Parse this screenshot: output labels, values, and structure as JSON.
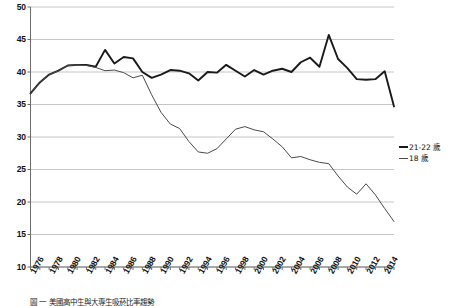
{
  "chart_data": {
    "type": "line",
    "title": "",
    "xlabel": "",
    "ylabel": "",
    "xlim": [
      1976,
      2015
    ],
    "ylim": [
      10,
      50
    ],
    "grid": true,
    "grid_axis": "y",
    "legend_position": "right",
    "y_ticks": [
      50,
      45,
      40,
      35,
      30,
      25,
      20,
      15,
      10
    ],
    "x_ticks": [
      1976,
      1978,
      1980,
      1982,
      1984,
      1986,
      1988,
      1990,
      1992,
      1994,
      1996,
      1998,
      2000,
      2002,
      2004,
      2006,
      2008,
      2010,
      2012,
      2014
    ],
    "x": [
      1976,
      1977,
      1978,
      1979,
      1980,
      1981,
      1982,
      1983,
      1984,
      1985,
      1986,
      1987,
      1988,
      1989,
      1990,
      1991,
      1992,
      1993,
      1994,
      1995,
      1996,
      1997,
      1998,
      1999,
      2000,
      2001,
      2002,
      2003,
      2004,
      2005,
      2006,
      2007,
      2008,
      2009,
      2010,
      2011,
      2012,
      2013,
      2014,
      2015
    ],
    "series": [
      {
        "name": "21-22 歲",
        "style": "thick",
        "color": "#1a1a1a",
        "values": [
          36.7,
          38.4,
          39.6,
          40.2,
          41.0,
          41.1,
          41.1,
          40.8,
          43.4,
          41.3,
          42.3,
          42.1,
          40.0,
          39.1,
          39.6,
          40.3,
          40.2,
          39.8,
          38.7,
          40.0,
          39.9,
          41.1,
          40.2,
          39.3,
          40.3,
          39.6,
          40.2,
          40.5,
          40.0,
          41.5,
          42.2,
          40.8,
          45.7,
          42.0,
          40.6,
          38.9,
          38.8,
          38.9,
          40.1,
          34.7
        ]
      },
      {
        "name": "18 歲",
        "style": "thin",
        "color": "#4a4a4a",
        "values": [
          36.7,
          38.4,
          39.6,
          40.2,
          41.0,
          41.1,
          41.0,
          40.7,
          40.2,
          40.3,
          39.9,
          39.1,
          39.5,
          36.5,
          33.8,
          32.0,
          31.3,
          29.3,
          27.7,
          27.5,
          28.2,
          29.7,
          31.2,
          31.6,
          31.1,
          30.8,
          29.7,
          28.5,
          26.8,
          27.0,
          26.5,
          26.1,
          25.9,
          24.0,
          22.3,
          21.2,
          22.8,
          21.1,
          19.0,
          17.0
        ]
      }
    ]
  },
  "legend": {
    "entries": [
      {
        "label": "21-22 歲",
        "style": "thick"
      },
      {
        "label": "18 歲",
        "style": "thin"
      }
    ]
  },
  "caption": {
    "text": "圖 一  美國高中生與大專生吸菸比率趨勢"
  },
  "colors": {
    "thick_line": "#1a1a1a",
    "thin_line": "#4a4a4a",
    "gridline": "#b8b8b8",
    "axis": "#6e6e6e",
    "background": "#ffffff"
  }
}
